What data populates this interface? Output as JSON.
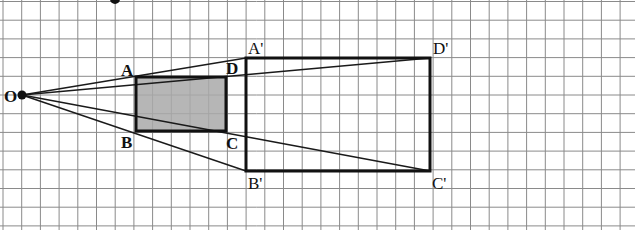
{
  "grid": {
    "x_lines": [
      3,
      21.7,
      40.4,
      59.1,
      77.8,
      96.5,
      115.2,
      133.9,
      152.6,
      171.3,
      190,
      208.7,
      227.4,
      246.1,
      264.8,
      283.5,
      302.2,
      320.9,
      339.6,
      358.3,
      377,
      395.7,
      414.4,
      433.1,
      451.8,
      470.5,
      489.2,
      507.9,
      526.6,
      545.3,
      564,
      582.7,
      601.4,
      620.1
    ],
    "y_lines": [
      1.5,
      20.2,
      38.9,
      57.6,
      76.3,
      95,
      113.7,
      132.4,
      151.1,
      169.8,
      188.5,
      207.2,
      225.9
    ],
    "color": "#8a8a8a"
  },
  "center": {
    "label": "O",
    "x": 22,
    "y": 95
  },
  "top_dot": {
    "x": 115,
    "y": 0
  },
  "small_rect": {
    "fill": "#a9a9a9",
    "vertices": {
      "A": {
        "label": "A",
        "x": 136,
        "y": 77
      },
      "D": {
        "label": "D",
        "x": 226,
        "y": 77
      },
      "C": {
        "label": "C",
        "x": 226,
        "y": 131
      },
      "B": {
        "label": "B",
        "x": 136,
        "y": 131
      }
    }
  },
  "large_rect": {
    "vertices": {
      "A'": {
        "label": "A'",
        "x": 246,
        "y": 58
      },
      "D'": {
        "label": "D'",
        "x": 430,
        "y": 58
      },
      "C'": {
        "label": "C'",
        "x": 430,
        "y": 171
      },
      "B'": {
        "label": "B'",
        "x": 246,
        "y": 171
      }
    }
  },
  "rays": [
    {
      "from": "O",
      "to": "A'"
    },
    {
      "from": "O",
      "to": "D'"
    },
    {
      "from": "O",
      "to": "C'"
    },
    {
      "from": "O",
      "to": "B'"
    }
  ],
  "labels": {
    "O": "O",
    "A": "A",
    "B": "B",
    "C": "C",
    "D": "D",
    "A_prime": "A'",
    "B_prime": "B'",
    "C_prime": "C'",
    "D_prime": "D'"
  }
}
